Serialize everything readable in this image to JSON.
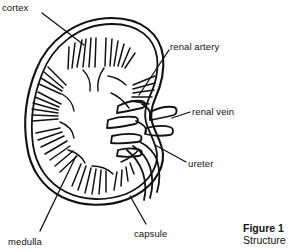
{
  "figure": {
    "caption_title": "Figure 1",
    "caption_subtitle": "Structure",
    "ink_color": "#111111",
    "background_color": "#ffffff"
  },
  "labels": {
    "cortex": "cortex",
    "renal_artery": "renal artery",
    "renal_vein": "renal vein",
    "ureter": "ureter",
    "capsule": "capsule",
    "medulla": "medulla"
  }
}
